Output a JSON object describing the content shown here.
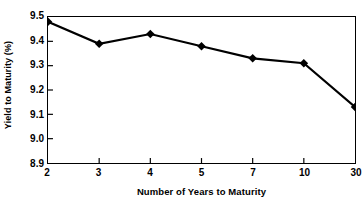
{
  "chart_data": {
    "type": "line",
    "title": "",
    "subtitle": "",
    "xlabel": "Number of Years to Maturity",
    "ylabel": "Yield to Maturity (%)",
    "categories": [
      "2",
      "3",
      "4",
      "5",
      "7",
      "10",
      "30"
    ],
    "values": [
      9.48,
      9.39,
      9.43,
      9.38,
      9.33,
      9.31,
      9.13
    ],
    "series": [
      {
        "name": "Yield to Maturity",
        "values": [
          9.48,
          9.39,
          9.43,
          9.38,
          9.33,
          9.31,
          9.13
        ]
      }
    ],
    "ylim": [
      8.9,
      9.5
    ],
    "ytick_labels": [
      "9.5",
      "9.4",
      "9.3",
      "9.2",
      "9.1",
      "9.0",
      "8.9"
    ],
    "ytick_values": [
      9.5,
      9.4,
      9.3,
      9.2,
      9.1,
      9.0,
      8.9
    ],
    "xtick_labels": [
      "2",
      "3",
      "4",
      "5",
      "7",
      "10",
      "30"
    ],
    "grid": false,
    "legend": null,
    "legend_position": "none",
    "marker": "diamond",
    "line_color": "#000000",
    "marker_color": "#000000",
    "background_color": "#ffffff",
    "axis_color": "#000000",
    "annotations": []
  }
}
